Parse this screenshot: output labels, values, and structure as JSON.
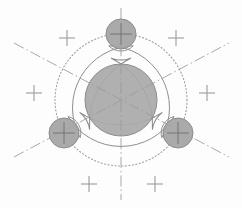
{
  "document": {
    "title": "Technical Drawing - Trefoil Cam Profile",
    "background_color": "#fdfdfd",
    "width": 242,
    "height": 208
  },
  "style": {
    "fill_gray": "#a9a9a9",
    "fill_gray_small": "#a5a5a5",
    "outline_color": "#8c8c8c",
    "contour_color": "#8a8a8a",
    "centerline_color": "#9a9a9a",
    "dotted_color": "#9e9e9e",
    "crosshair_color": "#a0a0a0"
  },
  "geometry": {
    "center": {
      "x": 121,
      "y": 100
    },
    "central_circle": {
      "label": "central-bore",
      "cx": 121,
      "cy": 100,
      "r": 36,
      "fill": "#a9a9a9",
      "stroke": "#8c8c8c"
    },
    "pitch_circle": {
      "label": "pitch-circle-dotted",
      "cx": 121,
      "cy": 100,
      "r": 66,
      "style": "dotted"
    },
    "satellite_circles": [
      {
        "label": "satellite-top",
        "cx": 121,
        "cy": 34,
        "r": 15,
        "angle_deg": 90
      },
      {
        "label": "satellite-bottom-left",
        "cx": 64,
        "cy": 133,
        "r": 15,
        "angle_deg": 210
      },
      {
        "label": "satellite-bottom-right",
        "cx": 178,
        "cy": 133,
        "r": 15,
        "angle_deg": 330
      }
    ],
    "outer_contour": {
      "label": "outer-profile",
      "lobe_radius": 26,
      "arc_radius": 74
    },
    "inner_contour": {
      "label": "inner-profile",
      "lobe_radius": 17,
      "arc_radius": 62
    },
    "center_lines": [
      {
        "label": "centerline-vertical",
        "angle_deg": 90,
        "x1": 121,
        "y1": 8,
        "x2": 121,
        "y2": 200
      },
      {
        "label": "centerline-diagonal-a",
        "angle_deg": 30,
        "x1": 14,
        "y1": 157,
        "x2": 229,
        "y2": 43
      },
      {
        "label": "centerline-diagonal-b",
        "angle_deg": 150,
        "x1": 14,
        "y1": 43,
        "x2": 229,
        "y2": 157
      }
    ],
    "crosshair_markers": [
      {
        "label": "marker-upper-left",
        "x": 67,
        "y": 38,
        "size": 16
      },
      {
        "label": "marker-upper-right",
        "x": 176,
        "y": 38,
        "size": 16
      },
      {
        "label": "marker-mid-left",
        "x": 34,
        "y": 93,
        "size": 16
      },
      {
        "label": "marker-mid-right",
        "x": 207,
        "y": 93,
        "size": 16
      },
      {
        "label": "marker-lower-left",
        "x": 89,
        "y": 184,
        "size": 16
      },
      {
        "label": "marker-lower-right",
        "x": 155,
        "y": 184,
        "size": 16
      }
    ],
    "satellite_crosshairs": [
      {
        "label": "satellite-crosshair-top",
        "x": 121,
        "y": 34,
        "size": 22
      },
      {
        "label": "satellite-crosshair-bottom-left",
        "x": 64,
        "y": 133,
        "size": 22
      },
      {
        "label": "satellite-crosshair-bottom-right",
        "x": 178,
        "y": 133,
        "size": 22
      }
    ]
  }
}
